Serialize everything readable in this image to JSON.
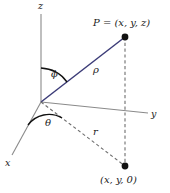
{
  "figure": {
    "type": "diagram",
    "background_color": "#ffffff",
    "colors": {
      "axis": "#8a8a8a",
      "rho_line": "#3c3c78",
      "dashed": "#6e6e6e",
      "point": "#111111",
      "arc": "#111111",
      "text": "#1a1a1a"
    },
    "axes": [
      {
        "name": "z",
        "label": "z",
        "label_x": 38,
        "label_y": 1
      },
      {
        "name": "y",
        "label": "y",
        "label_x": 151,
        "label_y": 109
      },
      {
        "name": "x",
        "label": "x",
        "label_x": 5,
        "label_y": 158
      }
    ],
    "angles": [
      {
        "name": "phi",
        "label": "ϕ",
        "label_x": 51,
        "label_y": 69,
        "between": "z-axis and rho"
      },
      {
        "name": "theta",
        "label": "θ",
        "label_x": 45,
        "label_y": 118,
        "between": "x-axis and r"
      }
    ],
    "segments": [
      {
        "name": "rho",
        "label": "ρ",
        "label_x": 93,
        "label_y": 65,
        "style": "solid",
        "color": "#3c3c78"
      },
      {
        "name": "r",
        "label": "r",
        "label_x": 93,
        "label_y": 127,
        "style": "dashed",
        "color": "#6e6e6e"
      }
    ],
    "points": [
      {
        "name": "P",
        "label": "P = (x, y, z)",
        "label_x": 93,
        "label_y": 18,
        "dot_x": 125,
        "dot_y": 37
      },
      {
        "name": "projection",
        "label": "(x, y, 0)",
        "label_x": 100,
        "label_y": 175,
        "dot_x": 125,
        "dot_y": 166
      }
    ],
    "geometry": {
      "origin": {
        "x": 41,
        "y": 102
      },
      "z_tip": {
        "x": 41,
        "y": 14
      },
      "y_tip": {
        "x": 148,
        "y": 113
      },
      "x_tip": {
        "x": 12,
        "y": 155
      }
    }
  }
}
